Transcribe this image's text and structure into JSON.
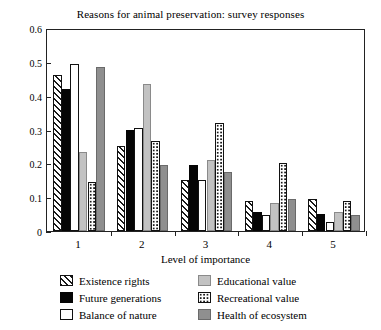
{
  "chart_data": {
    "type": "bar",
    "title": "Reasons for animal preservation: survey responses",
    "xlabel": "Level of importance",
    "ylabel": "Proportion",
    "categories": [
      "1",
      "2",
      "3",
      "4",
      "5"
    ],
    "ylim": [
      0,
      0.6
    ],
    "yticks": [
      "0",
      "0.1",
      "0.2",
      "0.3",
      "0.4",
      "0.5",
      "0.6"
    ],
    "ytick_values": [
      0,
      0.1,
      0.2,
      0.3,
      0.4,
      0.5,
      0.6
    ],
    "grid": false,
    "legend_position": "below",
    "series": [
      {
        "name": "Existence rights",
        "pattern": "diagonal-hatch",
        "color": "#ffffff",
        "values": [
          0.46,
          0.25,
          0.15,
          0.09,
          0.095
        ]
      },
      {
        "name": "Future generations",
        "pattern": "solid-black",
        "color": "#050505",
        "values": [
          0.42,
          0.3,
          0.195,
          0.055,
          0.05
        ]
      },
      {
        "name": "Balance of nature",
        "pattern": "solid-white",
        "color": "#ffffff",
        "values": [
          0.495,
          0.305,
          0.15,
          0.048,
          0.027
        ]
      },
      {
        "name": "Educational value",
        "pattern": "solid-lightgray",
        "color": "#c2c2c2",
        "values": [
          0.235,
          0.435,
          0.21,
          0.082,
          0.057
        ]
      },
      {
        "name": "Recreational value",
        "pattern": "dotted",
        "color": "#ffffff",
        "values": [
          0.145,
          0.265,
          0.32,
          0.2,
          0.09
        ]
      },
      {
        "name": "Health of ecosystem",
        "pattern": "solid-darkgray",
        "color": "#8f8f8f",
        "values": [
          0.485,
          0.195,
          0.175,
          0.095,
          0.048
        ]
      }
    ]
  }
}
